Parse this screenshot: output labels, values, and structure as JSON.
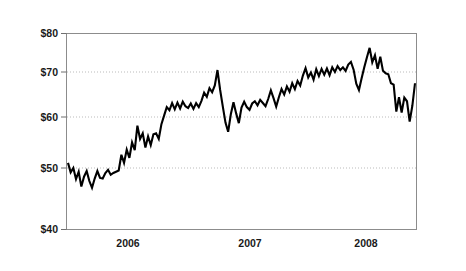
{
  "chart_data": {
    "type": "line",
    "title": "",
    "subtitle": "",
    "xlabel": "",
    "ylabel": "",
    "ylim": [
      40,
      80
    ],
    "y_ticks": [
      40,
      50,
      60,
      70,
      80
    ],
    "y_tick_labels": [
      "$40",
      "$50",
      "$60",
      "$70",
      "$80"
    ],
    "y_tick_pixel_positions": [
      230,
      168,
      117,
      72,
      33
    ],
    "y_axis_scale": "non-linear (compressed toward top)",
    "x_ticks": [
      2006,
      2007,
      2008
    ],
    "x_tick_labels": [
      "2006",
      "2007",
      "2008"
    ],
    "x_tick_pixel_positions": [
      128,
      250,
      366
    ],
    "xlim": [
      "2005-06",
      "2008-06"
    ],
    "grid": "horizontal dotted gridlines at $50, $60, $70",
    "legend": "none",
    "series": [
      {
        "name": "Price",
        "color": "#000000",
        "values": [
          51.0,
          49.3,
          50.0,
          48.2,
          49.4,
          47.0,
          48.6,
          49.5,
          47.9,
          46.8,
          48.3,
          49.5,
          48.4,
          48.3,
          49.2,
          49.7,
          48.9,
          49.2,
          49.4,
          49.6,
          52.6,
          51.0,
          53.6,
          52.0,
          55.0,
          53.5,
          58.3,
          55.7,
          56.8,
          54.0,
          56.2,
          54.5,
          56.6,
          56.8,
          55.7,
          58.6,
          60.3,
          62.2,
          61.5,
          63.1,
          61.7,
          63.2,
          61.9,
          63.4,
          62.4,
          62.0,
          63.0,
          61.8,
          63.1,
          62.2,
          63.6,
          65.4,
          64.5,
          66.4,
          65.5,
          67.0,
          70.5,
          66.0,
          62.3,
          58.9,
          57.1,
          60.6,
          63.3,
          60.8,
          58.8,
          62.1,
          63.4,
          62.2,
          61.6,
          63.0,
          63.5,
          62.6,
          63.8,
          63.1,
          62.4,
          64.0,
          65.9,
          64.2,
          62.3,
          64.4,
          66.2,
          65.0,
          66.8,
          65.6,
          67.5,
          66.2,
          68.0,
          67.0,
          69.2,
          71.0,
          68.8,
          69.9,
          68.3,
          70.7,
          69.1,
          70.8,
          69.4,
          70.9,
          69.3,
          71.2,
          70.0,
          71.5,
          70.5,
          71.2,
          70.3,
          71.9,
          72.6,
          70.6,
          67.4,
          66.0,
          68.6,
          71.2,
          73.8,
          76.2,
          72.5,
          74.3,
          70.8,
          73.9,
          70.3,
          69.7,
          69.5,
          67.5,
          67.2,
          61.2,
          64.4,
          61.0,
          64.3,
          63.5,
          59.1,
          62.5,
          67.5
        ],
        "n_points": 131,
        "start_value": 51.0,
        "end_value": 67.5,
        "min_value": 46.8,
        "max_value": 76.2
      }
    ],
    "annotations": []
  },
  "figure": {
    "frame_border_color": "#3a3a3a",
    "background_color": "#ffffff",
    "plot_border_color": "#8c8c8c",
    "gridline_color": "#b3b3b3",
    "line_color": "#000000"
  }
}
